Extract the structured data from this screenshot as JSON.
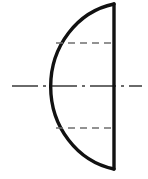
{
  "figure": {
    "type": "engineering-line-drawing",
    "canvas": {
      "width": 148,
      "height": 179,
      "background": "#ffffff"
    },
    "colors": {
      "outline": "#111111",
      "hidden_line": "#6f6f6f",
      "center_line": "#3a3a3a",
      "background": "#ffffff"
    },
    "geometry": {
      "center_x": 114,
      "center_y": 86,
      "radius_x": 78,
      "radius_y": 84,
      "arc_leftmost_x": 36,
      "vertical_edge_x": 114,
      "vertical_edge_top_y": 4,
      "vertical_edge_bottom_y": 169,
      "arc_sweep_degrees": 180,
      "arc_opens_toward": "left"
    },
    "strokes": {
      "outline_width": 3.4,
      "hidden_line_width": 1.6,
      "center_line_width": 1.6,
      "hidden_dash_pattern": "7 5",
      "center_dash_pattern": "26 5 3 5"
    },
    "elements": [
      {
        "name": "outline-vertical-edge",
        "kind": "solid-visible-edge",
        "x1": 114,
        "y1": 4,
        "x2": 114,
        "y2": 169
      },
      {
        "name": "outline-semicircular-arc",
        "kind": "solid-visible-arc",
        "start_x": 114,
        "start_y": 4,
        "end_x": 114,
        "end_y": 169,
        "radius_x": 78,
        "radius_y": 84
      },
      {
        "name": "hidden-line-upper",
        "kind": "dashed-hidden-line",
        "y": 43,
        "x1": 56,
        "x2": 116
      },
      {
        "name": "hidden-line-lower",
        "kind": "dashed-hidden-line",
        "y": 128,
        "x1": 56,
        "x2": 116
      },
      {
        "name": "axis-center-line",
        "kind": "dash-dot-center-line",
        "y": 86,
        "x1": 12,
        "x2": 142
      }
    ]
  }
}
